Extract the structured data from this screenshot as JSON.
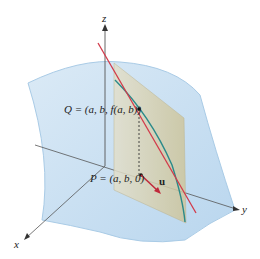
{
  "figure": {
    "axes": {
      "x": "x",
      "y": "y",
      "z": "z"
    },
    "point_Q": "Q = (a, b, f(a, b))",
    "point_P": "P = (a, b, 0)",
    "vector_u": "u"
  },
  "colors": {
    "surface": "#cfe3f3",
    "surface_edge": "#a9cbe6",
    "plane": "#d8d2b0",
    "tangent_line": "#d23a4a",
    "curve": "#2a8a8a",
    "axis": "#333333"
  }
}
